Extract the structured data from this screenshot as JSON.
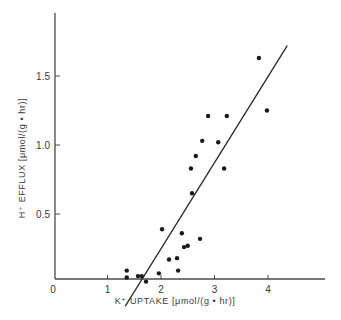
{
  "chart_data": {
    "type": "scatter",
    "title": "",
    "xlabel": "K⁺ UPTAKE [μmol/(g • hr)]",
    "ylabel": "H⁺ EFFLUX [μmol/(g • hr)]",
    "xlim": [
      0,
      5
    ],
    "ylim": [
      0,
      1.95
    ],
    "x_ticks": [
      0,
      1,
      2,
      3,
      4
    ],
    "x_tick_labels": [
      "0",
      "1",
      "2",
      "3",
      "4"
    ],
    "y_ticks": [
      0.5,
      1.0,
      1.5
    ],
    "y_tick_labels": [
      "0.5",
      "1.0",
      "1.5"
    ],
    "grid": false,
    "legend": null,
    "series": [
      {
        "name": "observations",
        "marker": "filled-circle",
        "points": [
          {
            "x": 3.83,
            "y": 1.63
          },
          {
            "x": 3.98,
            "y": 1.25
          },
          {
            "x": 2.88,
            "y": 1.21
          },
          {
            "x": 3.23,
            "y": 1.21
          },
          {
            "x": 2.77,
            "y": 1.03
          },
          {
            "x": 3.07,
            "y": 1.02
          },
          {
            "x": 2.65,
            "y": 0.92
          },
          {
            "x": 2.56,
            "y": 0.83
          },
          {
            "x": 3.18,
            "y": 0.83
          },
          {
            "x": 2.58,
            "y": 0.65
          },
          {
            "x": 2.02,
            "y": 0.39
          },
          {
            "x": 2.39,
            "y": 0.36
          },
          {
            "x": 2.73,
            "y": 0.32
          },
          {
            "x": 2.43,
            "y": 0.26
          },
          {
            "x": 2.5,
            "y": 0.27
          },
          {
            "x": 2.15,
            "y": 0.17
          },
          {
            "x": 2.3,
            "y": 0.18
          },
          {
            "x": 2.32,
            "y": 0.09
          },
          {
            "x": 1.96,
            "y": 0.07
          },
          {
            "x": 1.36,
            "y": 0.09
          },
          {
            "x": 1.36,
            "y": 0.04
          },
          {
            "x": 1.57,
            "y": 0.05
          },
          {
            "x": 1.64,
            "y": 0.05
          },
          {
            "x": 1.72,
            "y": 0.01
          }
        ]
      }
    ],
    "regression_line": {
      "name": "linear fit",
      "x0": 1.33,
      "y0": -0.17,
      "x1": 4.36,
      "y1": 1.72
    }
  },
  "colors": {
    "axis": "#4a4a4a",
    "marker": "#1a1a1a",
    "line": "#2a2a2a",
    "text": "#3a3a3a"
  }
}
